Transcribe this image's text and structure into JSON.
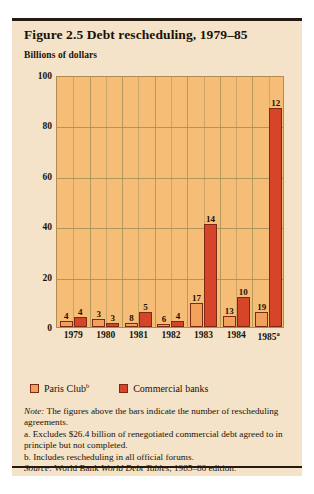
{
  "figure": {
    "title": "Figure 2.5  Debt rescheduling, 1979–85",
    "axis_unit": "Billions of dollars"
  },
  "legend": [
    {
      "label": "Paris Club",
      "sup": "b",
      "color": "#f2a15c",
      "name": "paris-club"
    },
    {
      "label": "Commercial banks",
      "sup": "",
      "color": "#d6452a",
      "name": "commercial-banks"
    }
  ],
  "notes": {
    "note_lead": "Note:",
    "note_text": " The figures above the bars indicate the number of rescheduling agreements.",
    "footnote_a": "a. Excludes $26.4 billion of renegotiated commercial debt agreed to in principle but not completed.",
    "footnote_b": "b. Includes rescheduling in all official forums.",
    "source_lead": "Source:",
    "source_text_1": " World Bank ",
    "source_italic": "World Debt Tables",
    "source_text_2": ", 1985–86 edition."
  },
  "chart_data": {
    "type": "bar",
    "title": "Figure 2.5  Debt rescheduling, 1979–85",
    "xlabel": "",
    "ylabel": "Billions of dollars",
    "ylim": [
      0,
      100
    ],
    "yticks": [
      0,
      20,
      40,
      60,
      80,
      100
    ],
    "grid": true,
    "legend_position": "below-axes",
    "categories": [
      "1979",
      "1980",
      "1981",
      "1982",
      "1983",
      "1984",
      "1985a"
    ],
    "category_labels": [
      "1979",
      "1980",
      "1981",
      "1982",
      "1983",
      "1984",
      "1985"
    ],
    "category_superscripts": [
      "",
      "",
      "",
      "",
      "",
      "",
      "a"
    ],
    "series": [
      {
        "name": "Paris Club",
        "color": "#f2a15c",
        "values": [
          2.5,
          3.0,
          1.5,
          1.0,
          9.5,
          4.5,
          6.0
        ],
        "data_labels": [
          "4",
          "3",
          "8",
          "6",
          "17",
          "13",
          "19"
        ]
      },
      {
        "name": "Commercial banks",
        "color": "#d6452a",
        "values": [
          4.0,
          1.5,
          6.0,
          2.5,
          41.0,
          12.0,
          87.0
        ],
        "data_labels": [
          "4",
          "3",
          "5",
          "4",
          "14",
          "10",
          "12"
        ]
      }
    ],
    "annotation": "Figures above the bars indicate the number of rescheduling agreements."
  }
}
